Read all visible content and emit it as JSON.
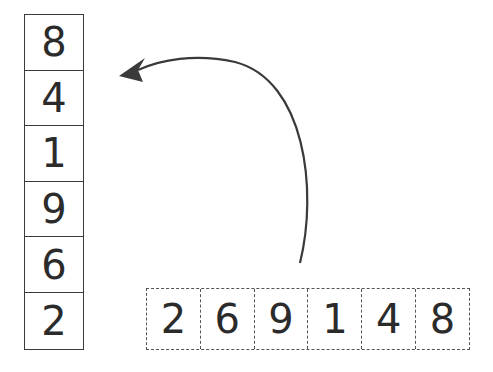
{
  "stack": {
    "label": "stack",
    "items": [
      "8",
      "4",
      "1",
      "9",
      "6",
      "2"
    ]
  },
  "sequence": {
    "label": "input-sequence",
    "items": [
      "2",
      "6",
      "9",
      "1",
      "4",
      "8"
    ]
  },
  "arrow": {
    "direction": "from sequence to stack top",
    "color": "#3a3a3a"
  }
}
